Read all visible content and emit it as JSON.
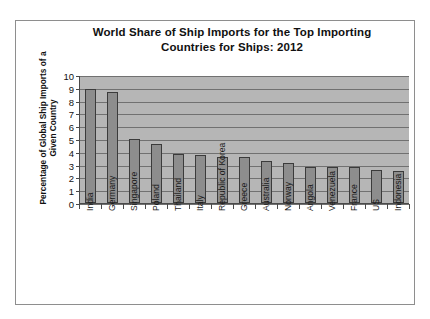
{
  "chart_data": {
    "type": "bar",
    "title": "World Share of Ship Imports for the Top Importing Countries for Ships: 2012",
    "title_line1": "World Share of Ship Imports for the Top Importing",
    "title_line2": "Countries for Ships: 2012",
    "xlabel": "",
    "ylabel": "Percentage of Global Ship Imports of a Given Country",
    "ylabel_line1": "Percentage of Global Ship Imports of a",
    "ylabel_line2": "Given Country",
    "ylim": [
      0,
      10
    ],
    "ytick_labels": [
      "10",
      "9",
      "8",
      "7",
      "6",
      "5",
      "4",
      "3",
      "2",
      "1",
      "0"
    ],
    "yticks": [
      10,
      9,
      8,
      7,
      6,
      5,
      4,
      3,
      2,
      1,
      0
    ],
    "grid": true,
    "legend": false,
    "categories": [
      "India",
      "Germany",
      "Singapore",
      "Poland",
      "Thailand",
      "Italy",
      "Republic of Korea",
      "Greece",
      "Australia",
      "Norway",
      "Angola",
      "Venezuela",
      "France",
      "US",
      "Indonesia"
    ],
    "values": [
      8.9,
      8.7,
      5.0,
      4.6,
      3.8,
      3.75,
      3.6,
      3.6,
      3.25,
      3.15,
      2.8,
      2.85,
      2.8,
      2.6,
      2.5
    ],
    "colors": {
      "bar_fill": "#8d8d8d",
      "bar_stroke": "#3b3b3b",
      "plot_background": "#b6b6b6",
      "gridline": "#717171",
      "axis": "#4a4a4a",
      "text": "#111111",
      "frame": "#8e8e8e",
      "page_background": "#ffffff"
    }
  }
}
